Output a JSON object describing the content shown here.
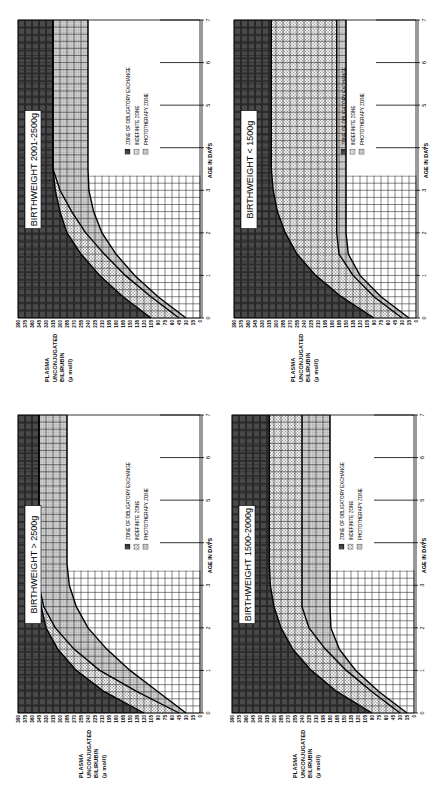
{
  "orientation": "rotated -90deg (charts printed sideways)",
  "y_axis_label_lines": [
    "PLASMA",
    "UNCONJUGATED",
    "BILIRUBIN",
    "(μ mol/l)"
  ],
  "x_axis_label": "AGE   IN   DAYS",
  "legend": [
    {
      "label": "ZONE OF OBLIGATORY EXCHANGE",
      "pattern": "dark-grid",
      "color": "#3a3a3a"
    },
    {
      "label": "INDEFINITE ZONE",
      "pattern": "dots",
      "color": "#d9d9d9"
    },
    {
      "label": "PHOTOTHERAPY ZONE",
      "pattern": "light-hatch",
      "color": "#bdbdbd"
    }
  ],
  "y_ticks": [
    0,
    15,
    30,
    45,
    60,
    75,
    90,
    105,
    120,
    135,
    150,
    165,
    180,
    195,
    210,
    225,
    240,
    255,
    270,
    285,
    300,
    315,
    330,
    345,
    360,
    375,
    390
  ],
  "x_ticks": [
    0,
    1,
    2,
    3,
    4,
    5,
    6,
    7
  ],
  "panels": [
    {
      "id": "p2001",
      "title": "BIRTHWEIGHT   2001-2500g",
      "pos": "top-left"
    },
    {
      "id": "p1500",
      "title": "BIRTHWEIGHT < 1500g",
      "pos": "top-right"
    },
    {
      "id": "p2500",
      "title": "BIRTHWEIGHT > 2500g",
      "pos": "bottom-left"
    },
    {
      "id": "p1520",
      "title": "BIRTHWEIGHT   1500-2000g",
      "pos": "bottom-right"
    }
  ],
  "chart_data": [
    {
      "type": "area",
      "title": "BIRTHWEIGHT 2001-2500g",
      "xlabel": "AGE IN DAYS",
      "ylabel": "PLASMA UNCONJUGATED BILIRUBIN (μ mol/l)",
      "xlim": [
        0,
        7
      ],
      "ylim": [
        0,
        390
      ],
      "x": [
        0,
        0.5,
        1,
        1.5,
        2,
        2.5,
        3,
        3.5,
        7
      ],
      "series": [
        {
          "name": "Exchange threshold (upper bound of indefinite zone)",
          "values": [
            105,
            165,
            215,
            255,
            285,
            300,
            310,
            315,
            315
          ]
        },
        {
          "name": "Indefinite/phototherapy boundary",
          "values": [
            45,
            105,
            160,
            205,
            245,
            275,
            300,
            315,
            315
          ]
        },
        {
          "name": "Phototherapy threshold (lower bound)",
          "values": [
            30,
            90,
            140,
            180,
            210,
            228,
            238,
            240,
            240
          ]
        }
      ],
      "grid": true,
      "legend_position": "upper right (rotated)"
    },
    {
      "type": "area",
      "title": "BIRTHWEIGHT < 1500g",
      "xlabel": "AGE IN DAYS",
      "ylabel": "PLASMA UNCONJUGATED BILIRUBIN (μ mol/l)",
      "xlim": [
        0,
        7
      ],
      "ylim": [
        0,
        390
      ],
      "x": [
        0,
        0.5,
        1,
        1.5,
        2,
        2.5,
        3,
        3.5,
        7
      ],
      "series": [
        {
          "name": "Exchange threshold (upper bound of indefinite zone)",
          "values": [
            90,
            160,
            215,
            255,
            280,
            297,
            306,
            310,
            310
          ]
        },
        {
          "name": "Indefinite/phototherapy boundary",
          "values": [
            30,
            90,
            135,
            165,
            170,
            170,
            170,
            170,
            170
          ]
        },
        {
          "name": "Phototherapy threshold (lower bound)",
          "values": [
            15,
            75,
            120,
            145,
            150,
            150,
            150,
            150,
            150
          ]
        }
      ],
      "grid": true,
      "legend_position": "upper right (rotated)"
    },
    {
      "type": "area",
      "title": "BIRTHWEIGHT > 2500g",
      "xlabel": "AGE IN DAYS",
      "ylabel": "PLASMA UNCONJUGATED BILIRUBIN (μ mol/l)",
      "xlim": [
        0,
        7
      ],
      "ylim": [
        0,
        390
      ],
      "x": [
        0,
        0.5,
        1,
        1.5,
        2,
        2.5,
        3,
        3.5,
        7
      ],
      "series": [
        {
          "name": "Exchange threshold (upper bound of indefinite zone)",
          "values": [
            120,
            205,
            265,
            305,
            330,
            340,
            345,
            345,
            345
          ]
        },
        {
          "name": "Indefinite/phototherapy boundary",
          "values": [
            45,
            135,
            215,
            270,
            310,
            335,
            345,
            345,
            345
          ]
        },
        {
          "name": "Phototherapy threshold (lower bound)",
          "values": [
            30,
            90,
            150,
            200,
            240,
            265,
            280,
            285,
            285
          ]
        }
      ],
      "grid": true,
      "legend_position": "upper right (rotated)"
    },
    {
      "type": "area",
      "title": "BIRTHWEIGHT 1500-2000g",
      "xlabel": "AGE IN DAYS",
      "ylabel": "PLASMA UNCONJUGATED BILIRUBIN (μ mol/l)",
      "xlim": [
        0,
        7
      ],
      "ylim": [
        0,
        390
      ],
      "x": [
        0,
        0.5,
        1,
        1.5,
        2,
        2.5,
        3,
        3.5,
        7
      ],
      "series": [
        {
          "name": "Exchange threshold (upper bound of indefinite zone)",
          "values": [
            90,
            165,
            220,
            260,
            285,
            300,
            308,
            310,
            310
          ]
        },
        {
          "name": "Indefinite/phototherapy boundary",
          "values": [
            30,
            90,
            145,
            190,
            225,
            240,
            240,
            240,
            240
          ]
        },
        {
          "name": "Phototherapy threshold (lower bound)",
          "values": [
            15,
            75,
            125,
            160,
            178,
            180,
            180,
            180,
            180
          ]
        }
      ],
      "grid": true,
      "legend_position": "upper right (rotated)"
    }
  ]
}
